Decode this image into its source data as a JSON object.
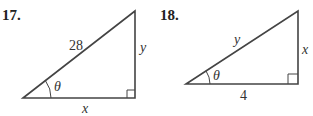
{
  "problems": [
    {
      "number": "17.",
      "hypotenuse": "28",
      "opposite": "y",
      "adjacent": "x",
      "angle": "θ"
    },
    {
      "number": "18.",
      "hypotenuse": "y",
      "opposite": "x",
      "adjacent": "4",
      "angle": "θ"
    }
  ],
  "colors": {
    "line": "#444444",
    "text": "#333333"
  }
}
